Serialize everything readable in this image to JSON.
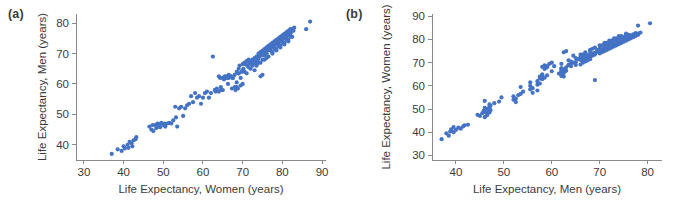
{
  "figure": {
    "background_color": "#ffffff",
    "marker_color": "#4472c4",
    "axis_color": "#8a8a8a",
    "text_color": "#3b3b3b"
  },
  "panels": [
    {
      "key": "a",
      "label": "(a)",
      "xlabel": "Life Expectancy, Women (years)",
      "ylabel": "Life Expectancy, Men (years)",
      "xticks": [
        30,
        40,
        50,
        60,
        70,
        80,
        90
      ],
      "yticks": [
        40,
        50,
        60,
        70,
        80
      ],
      "xlim": [
        28,
        91
      ],
      "ylim": [
        35,
        83
      ]
    },
    {
      "key": "b",
      "label": "(b)",
      "xlabel": "Life Expectancy, Men (years)",
      "ylabel": "Life Expectancy, Women (years)",
      "xticks": [
        40,
        50,
        60,
        70,
        80
      ],
      "yticks": [
        30,
        40,
        50,
        60,
        70,
        80,
        90
      ],
      "xlim": [
        35,
        83
      ],
      "ylim": [
        28,
        91
      ]
    }
  ],
  "chart_data": [
    {
      "type": "scatter",
      "panel": "a",
      "title": "",
      "xlabel": "Life Expectancy, Women (years)",
      "ylabel": "Life Expectancy, Men (years)",
      "xlim": [
        28,
        91
      ],
      "ylim": [
        35,
        83
      ],
      "xticks": [
        30,
        40,
        50,
        60,
        70,
        80,
        90
      ],
      "yticks": [
        40,
        50,
        60,
        70,
        80
      ],
      "grid": false,
      "legend": null,
      "series": [
        {
          "name": "Countries",
          "marker": "circle",
          "color": "#4472c4",
          "x": [
            37.0,
            38.5,
            39.5,
            40.0,
            40.3,
            41.0,
            41.2,
            41.5,
            42.0,
            42.2,
            42.5,
            43.0,
            43.2,
            46.5,
            47.0,
            47.3,
            47.5,
            48.0,
            48.2,
            48.5,
            48.8,
            49.0,
            49.2,
            49.5,
            50.0,
            50.3,
            50.5,
            51.0,
            51.5,
            52.0,
            52.5,
            53.0,
            53.2,
            53.5,
            54.0,
            54.5,
            55.0,
            55.5,
            56.0,
            56.5,
            57.0,
            57.5,
            58.0,
            58.5,
            59.0,
            59.5,
            60.0,
            60.5,
            61.0,
            61.5,
            62.0,
            62.5,
            63.0,
            63.2,
            63.5,
            64.0,
            64.3,
            64.5,
            65.0,
            65.3,
            65.5,
            66.0,
            66.3,
            66.5,
            67.0,
            67.3,
            67.5,
            68.0,
            68.2,
            68.5,
            68.8,
            69.0,
            69.2,
            69.5,
            69.8,
            70.0,
            70.2,
            70.5,
            70.8,
            71.0,
            71.2,
            71.5,
            71.8,
            72.0,
            72.2,
            72.5,
            72.8,
            73.0,
            73.2,
            73.5,
            73.8,
            74.0,
            74.2,
            74.5,
            74.8,
            75.0,
            75.2,
            75.5,
            75.8,
            76.0,
            76.2,
            76.5,
            76.8,
            77.0,
            77.2,
            77.5,
            77.8,
            78.0,
            78.2,
            78.5,
            78.8,
            79.0,
            79.2,
            79.5,
            79.8,
            80.0,
            80.2,
            80.5,
            80.8,
            81.0,
            81.2,
            81.5,
            81.8,
            82.0,
            82.2,
            82.5,
            82.8,
            83.0,
            87.0,
            86.0,
            71.0,
            73.0,
            74.5,
            75.0,
            68.5,
            69.5,
            70.0,
            74.0,
            75.5,
            76.0,
            72.0,
            73.5,
            77.0,
            78.0,
            79.0,
            80.0,
            81.0,
            82.0,
            74.0,
            75.0,
            76.0,
            77.5,
            78.5,
            79.5,
            80.5,
            81.5,
            82.5,
            70.5,
            71.5,
            72.5,
            73.5,
            74.5,
            75.5,
            76.5,
            77.5,
            78.5,
            79.5,
            80.5,
            81.5,
            63.0,
            64.5,
            65.5,
            66.5,
            67.5,
            68.5,
            69.0,
            64.0,
            65.0,
            66.0,
            67.0,
            68.0,
            69.0,
            70.0,
            75.0,
            76.0,
            77.0,
            78.0,
            79.0,
            80.0,
            81.0,
            82.0
          ],
          "y": [
            37.0,
            38.5,
            38.0,
            39.5,
            38.8,
            40.0,
            39.0,
            41.0,
            40.5,
            39.5,
            41.5,
            41.8,
            42.5,
            46.0,
            45.0,
            46.5,
            44.5,
            46.5,
            45.5,
            47.0,
            46.0,
            46.8,
            45.8,
            47.2,
            46.5,
            47.0,
            46.0,
            47.0,
            47.2,
            47.0,
            48.0,
            52.5,
            49.0,
            46.0,
            52.0,
            52.5,
            49.5,
            52.0,
            53.0,
            53.5,
            56.0,
            54.0,
            57.0,
            55.5,
            56.0,
            53.5,
            55.5,
            57.0,
            57.5,
            55.5,
            57.0,
            69.0,
            58.0,
            57.5,
            58.5,
            62.5,
            62.0,
            58.0,
            62.0,
            61.5,
            62.0,
            62.5,
            60.0,
            62.0,
            62.5,
            58.5,
            62.0,
            59.0,
            58.0,
            60.5,
            58.5,
            63.5,
            66.0,
            62.0,
            64.0,
            66.5,
            65.0,
            67.0,
            66.5,
            67.5,
            66.0,
            68.0,
            67.0,
            67.5,
            66.5,
            68.0,
            67.0,
            68.5,
            67.5,
            69.0,
            68.0,
            70.0,
            69.0,
            70.5,
            69.5,
            71.0,
            70.0,
            71.5,
            70.5,
            72.0,
            71.0,
            72.5,
            71.5,
            73.0,
            72.0,
            73.5,
            72.5,
            74.0,
            73.0,
            74.5,
            73.5,
            75.0,
            74.0,
            75.5,
            74.5,
            76.0,
            75.0,
            76.5,
            75.5,
            77.0,
            76.0,
            77.5,
            76.5,
            78.0,
            77.0,
            78.0,
            77.5,
            78.5,
            80.5,
            78.0,
            63.5,
            64.5,
            62.5,
            63.0,
            59.0,
            59.5,
            60.0,
            68.5,
            69.5,
            70.0,
            65.0,
            66.0,
            71.0,
            72.0,
            73.0,
            74.0,
            75.0,
            76.0,
            67.0,
            68.0,
            68.5,
            70.5,
            71.5,
            72.5,
            73.5,
            74.5,
            75.5,
            64.0,
            65.5,
            66.0,
            66.5,
            67.0,
            68.0,
            69.0,
            70.0,
            71.0,
            72.0,
            73.0,
            74.0,
            58.0,
            59.0,
            62.5,
            63.0,
            62.0,
            64.0,
            65.0,
            57.5,
            58.0,
            62.0,
            62.5,
            63.0,
            63.5,
            64.5,
            69.5,
            70.0,
            71.0,
            71.5,
            72.5,
            73.5,
            74.5,
            75.5
          ]
        }
      ]
    },
    {
      "type": "scatter",
      "panel": "b",
      "title": "",
      "xlabel": "Life Expectancy, Men (years)",
      "ylabel": "Life Expectancy, Women (years)",
      "xlim": [
        35,
        83
      ],
      "ylim": [
        28,
        91
      ],
      "xticks": [
        40,
        50,
        60,
        70,
        80
      ],
      "yticks": [
        30,
        40,
        50,
        60,
        70,
        80,
        90
      ],
      "grid": false,
      "legend": null,
      "note": "Same data as panel (a) with x and y axes swapped.",
      "series": [
        {
          "name": "Countries",
          "marker": "circle",
          "color": "#4472c4",
          "swap_of_panel": "a"
        }
      ]
    }
  ]
}
